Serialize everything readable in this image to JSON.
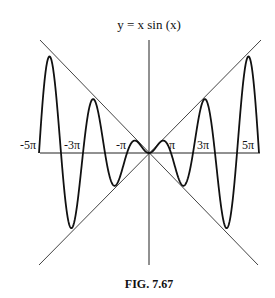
{
  "figure": {
    "title": "y = x sin (x)",
    "caption": "FIG. 7.67"
  },
  "chart_data": {
    "type": "line",
    "title": "y = x sin (x)",
    "function": "x*sin(x)",
    "xlabel": "",
    "ylabel": "",
    "xlim": [
      -5,
      5
    ],
    "xlim_units": "pi",
    "x_tick_labels": [
      "-5π",
      "-3π",
      "-π",
      "π",
      "3π",
      "5π"
    ],
    "x_tick_values_in_pi": [
      -5,
      -3,
      -1,
      1,
      3,
      5
    ],
    "grid": false,
    "legend": null,
    "envelope_lines": [
      "y = x",
      "y = -x"
    ],
    "series": [
      {
        "name": "y = x sin(x)",
        "samples": "computed from function over [-5π, 5π]"
      },
      {
        "name": "y = x",
        "style": "thin line"
      },
      {
        "name": "y = -x",
        "style": "thin line"
      }
    ]
  },
  "colors": {
    "curve": "#111111",
    "axes": "#222222",
    "envelope": "#444444",
    "background": "#ffffff"
  }
}
